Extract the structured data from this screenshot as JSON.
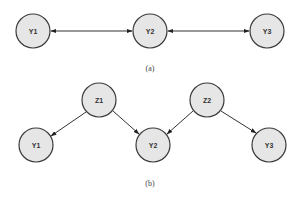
{
  "diagram_a": {
    "caption": "(a)",
    "nodes": [
      {
        "id": "Y1",
        "label": "Y1",
        "cx": 33,
        "cy": 31
      },
      {
        "id": "Y2",
        "label": "Y2",
        "cx": 150,
        "cy": 31
      },
      {
        "id": "Y3",
        "label": "Y3",
        "cx": 267,
        "cy": 31
      }
    ],
    "edges": [
      {
        "from": "Y1",
        "to": "Y2",
        "type": "bidirectional"
      },
      {
        "from": "Y2",
        "to": "Y3",
        "type": "bidirectional"
      }
    ]
  },
  "diagram_b": {
    "caption": "(b)",
    "nodes": [
      {
        "id": "Z1",
        "label": "Z1",
        "cx": 99,
        "cy": 100
      },
      {
        "id": "Z2",
        "label": "Z2",
        "cx": 207,
        "cy": 100
      },
      {
        "id": "Y1",
        "label": "Y1",
        "cx": 36,
        "cy": 144
      },
      {
        "id": "Y2",
        "label": "Y2",
        "cx": 153,
        "cy": 144
      },
      {
        "id": "Y3",
        "label": "Y3",
        "cx": 269,
        "cy": 144
      }
    ],
    "edges": [
      {
        "from": "Z1",
        "to": "Y1",
        "type": "directed"
      },
      {
        "from": "Z1",
        "to": "Y2",
        "type": "directed"
      },
      {
        "from": "Z2",
        "to": "Y2",
        "type": "directed"
      },
      {
        "from": "Z2",
        "to": "Y3",
        "type": "directed"
      }
    ]
  },
  "style": {
    "node_fill": "#e6e6e6",
    "node_stroke": "#3a3a3a",
    "edge_color": "#333333",
    "node_radius": 17
  }
}
